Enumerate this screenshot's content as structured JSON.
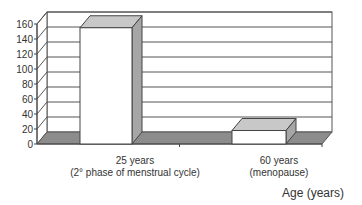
{
  "chart_data": {
    "type": "bar",
    "style": "3d",
    "title": "",
    "categories": [
      "25 years\n(2° phase of menstrual cycle)",
      "60 years\n(menopause)"
    ],
    "category_lines": [
      [
        "25 years",
        "(2° phase of menstrual cycle)"
      ],
      [
        "60 years",
        "(menopause)"
      ]
    ],
    "values": [
      155,
      18
    ],
    "xlabel": "Age (years)",
    "ylabel": "",
    "ylim": [
      0,
      160
    ],
    "yticks": [
      0,
      20,
      40,
      60,
      80,
      100,
      120,
      140,
      160
    ],
    "grid": true,
    "legend": null,
    "colors": {
      "bar_front": "#ffffff",
      "bar_top": "#c8c8c8",
      "bar_side": "#a6a6a6",
      "floor": "#8c8c8c",
      "wall": "#ffffff",
      "gridline": "#555555"
    }
  }
}
